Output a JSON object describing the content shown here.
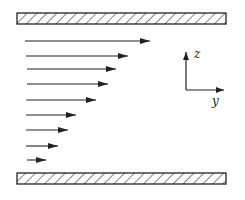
{
  "diagram": {
    "axes": {
      "vertical_label": "z",
      "horizontal_label": "y"
    },
    "plates": [
      {
        "name": "top-plate",
        "x": 17,
        "y": 13,
        "width": 209,
        "height": 11
      },
      {
        "name": "bottom-plate",
        "x": 17,
        "y": 173,
        "width": 209,
        "height": 11
      }
    ],
    "arrows": [
      {
        "y": 41,
        "x_start": 25,
        "x_end": 150
      },
      {
        "y": 56,
        "x_start": 26,
        "x_end": 128
      },
      {
        "y": 69,
        "x_start": 27,
        "x_end": 116
      },
      {
        "y": 84,
        "x_start": 27,
        "x_end": 108
      },
      {
        "y": 100,
        "x_start": 26,
        "x_end": 96
      },
      {
        "y": 115,
        "x_start": 26,
        "x_end": 76
      },
      {
        "y": 130,
        "x_start": 26,
        "x_end": 68
      },
      {
        "y": 146,
        "x_start": 26,
        "x_end": 58
      },
      {
        "y": 160,
        "x_start": 27,
        "x_end": 46
      }
    ],
    "colors": {
      "stroke": "#222222",
      "background": "#ffffff"
    }
  }
}
